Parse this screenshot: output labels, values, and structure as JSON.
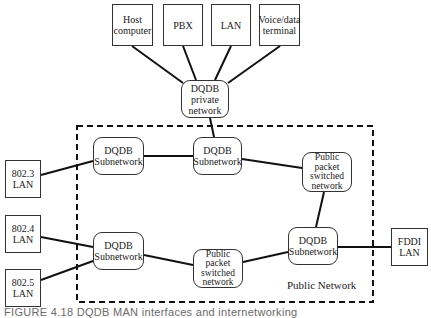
{
  "nodes": {
    "host_computer": "Host\ncomputer",
    "pbx": "PBX",
    "lan_top": "LAN",
    "voice_data_terminal": "Voice/data\nterminal",
    "dqdb_private": "DQDB\nprivate\nnetwork",
    "dqdb_sub_top_left": "DQDB\nSubnetwork",
    "dqdb_sub_top_mid": "DQDB\nSubnetwork",
    "public_packet_top": "Public\npacket\nswitched\nnetwork",
    "lan_8023": "802.3\nLAN",
    "lan_8024": "802.4\nLAN",
    "lan_8025": "802.5\nLAN",
    "dqdb_sub_bottom_left": "DQDB\nSubnetwork",
    "public_packet_bottom": "Public\npacket\nswitched\nnetwork",
    "dqdb_sub_bottom_right": "DQDB\nSubnetwork",
    "fddi_lan": "FDDI\nLAN"
  },
  "region_label": "Public Network",
  "caption": "FIGURE 4.18  DQDB MAN interfaces and internetworking",
  "colors": {
    "line": "#111111",
    "border": "#333333",
    "caption": "#6a6a6a"
  }
}
